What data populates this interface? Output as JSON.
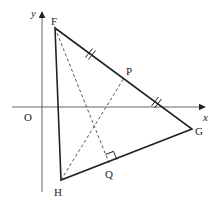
{
  "figure": {
    "width": 221,
    "height": 205,
    "colors": {
      "axis": "#666666",
      "triangle": "#222222",
      "dashed": "#555555",
      "label": "#222222"
    }
  },
  "axes": {
    "origin_label": "O",
    "x_label": "x",
    "y_label": "y",
    "origin": {
      "x": 42,
      "y": 107
    },
    "x_axis": {
      "x1": 12,
      "x2": 205,
      "y": 107
    },
    "y_axis": {
      "x": 42,
      "y1": 192,
      "y2": 12
    }
  },
  "points": {
    "F": {
      "label": "F",
      "x": 55,
      "y": 28
    },
    "G": {
      "label": "G",
      "x": 192,
      "y": 129
    },
    "H": {
      "label": "H",
      "x": 61,
      "y": 180
    },
    "P": {
      "label": "P",
      "x": 124,
      "y": 78
    },
    "Q": {
      "label": "Q",
      "x": 109,
      "y": 163
    }
  },
  "segments": {
    "solid": [
      "FG",
      "GH",
      "HF"
    ],
    "dashed": [
      "FQ",
      "HP"
    ]
  },
  "annotations": {
    "equal_length_marks": "FP = PG (double ticks)",
    "right_angle": "FQ ⟂ HG at Q"
  }
}
